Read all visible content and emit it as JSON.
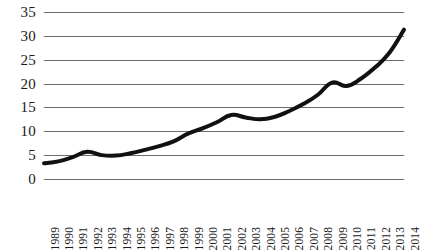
{
  "chart_data": {
    "type": "line",
    "title": "",
    "subtitle": "",
    "xlabel": "",
    "ylabel": "",
    "x": [
      1989,
      1990,
      1991,
      1992,
      1993,
      1994,
      1995,
      1996,
      1997,
      1998,
      1999,
      2000,
      2001,
      2002,
      2003,
      2004,
      2005,
      2006,
      2007,
      2008,
      2009,
      2010,
      2011,
      2012,
      2013,
      2014
    ],
    "categories": [
      "1989",
      "1990",
      "1991",
      "1992",
      "1993",
      "1994",
      "1995",
      "1996",
      "1997",
      "1998",
      "1999",
      "2000",
      "2001",
      "2002",
      "2003",
      "2004",
      "2005",
      "2006",
      "2007",
      "2008",
      "2009",
      "2010",
      "2011",
      "2012",
      "2013",
      "2014"
    ],
    "values": [
      3.3,
      3.7,
      4.6,
      5.7,
      5.0,
      4.9,
      5.4,
      6.1,
      6.9,
      7.9,
      9.5,
      10.6,
      11.9,
      13.4,
      12.9,
      12.5,
      13.0,
      14.2,
      15.7,
      17.6,
      20.2,
      19.5,
      21.0,
      23.4,
      26.5,
      31.3
    ],
    "series": [
      {
        "name": "",
        "color": "#111111",
        "values": [
          3.3,
          3.7,
          4.6,
          5.7,
          5.0,
          4.9,
          5.4,
          6.1,
          6.9,
          7.9,
          9.5,
          10.6,
          11.9,
          13.4,
          12.9,
          12.5,
          13.0,
          14.2,
          15.7,
          17.6,
          20.2,
          19.5,
          21.0,
          23.4,
          26.5,
          31.3
        ]
      }
    ],
    "ylim": [
      0,
      35
    ],
    "xlim": [
      1989,
      2014
    ],
    "yticks": [
      0,
      5,
      10,
      15,
      20,
      25,
      30,
      35
    ],
    "ytick_labels": [
      "0",
      "5",
      "10",
      "15",
      "20",
      "25",
      "30",
      "35"
    ],
    "grid": true,
    "grid_color": "#6d6d6d",
    "legend": false,
    "legend_position": "none",
    "line_width": 4,
    "xtick_rotation": -90,
    "background": "#ffffff"
  }
}
